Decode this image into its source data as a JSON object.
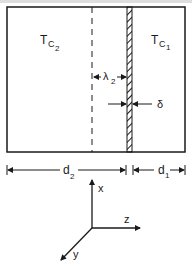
{
  "diagram": {
    "header_cut_text": "...  ...",
    "regions": [
      {
        "id": "region-2",
        "label_main": "T",
        "label_sub": "C",
        "label_sub2": "2"
      },
      {
        "id": "region-1",
        "label_main": "T",
        "label_sub": "C",
        "label_sub2": "1"
      }
    ],
    "annotations": {
      "lambda": {
        "main": "λ",
        "sub": "2"
      },
      "delta": "δ"
    },
    "dimensions": {
      "d2": {
        "main": "d",
        "sub": "2"
      },
      "d1": {
        "main": "d",
        "sub": "1"
      }
    },
    "axes": {
      "x": "x",
      "y": "y",
      "z": "z"
    },
    "colors": {
      "line": "#1a1a1a",
      "background": "#ffffff"
    }
  }
}
